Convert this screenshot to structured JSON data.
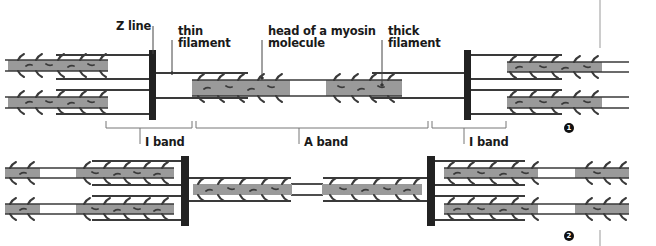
{
  "colors": {
    "filament_line": "#3a3a3a",
    "thick_fill": "#9a9a9a",
    "z_line": "#222222",
    "label": "#1a1a1a",
    "bracket": "#777777"
  },
  "labels": {
    "z_line": "Z line",
    "thin_filament_1": "thin",
    "thin_filament_2": "filament",
    "myosin_head_1": "head of a myosin",
    "myosin_head_2": "molecule",
    "thick_filament_1": "thick",
    "thick_filament_2": "filament",
    "i_band_left": "I band",
    "a_band": "A band",
    "i_band_right": "I band"
  },
  "panels": [
    {
      "id": 1,
      "marker": "1",
      "state": "relaxed"
    },
    {
      "id": 2,
      "marker": "2",
      "state": "contracted"
    }
  ]
}
